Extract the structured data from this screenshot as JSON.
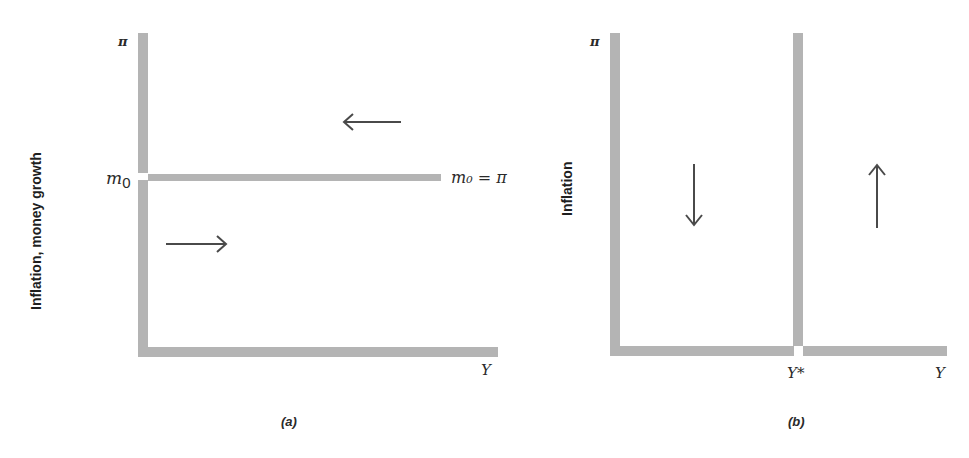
{
  "panel_a": {
    "caption": "(a)",
    "y_axis_label": "Inflation, money growth",
    "y_axis_symbol": "π",
    "x_axis_symbol": "Y",
    "y_tick_label": "m",
    "y_tick_subscript": "0",
    "line_label": "m₀ = π",
    "arrows": [
      {
        "direction": "left",
        "region": "above line"
      },
      {
        "direction": "right",
        "region": "below line"
      }
    ]
  },
  "panel_b": {
    "caption": "(b)",
    "y_axis_label": "Inflation",
    "y_axis_symbol": "π",
    "x_axis_symbol": "Y",
    "x_tick_label": "Y*",
    "arrows": [
      {
        "direction": "down",
        "region": "left of Y*"
      },
      {
        "direction": "up",
        "region": "right of Y*"
      }
    ]
  },
  "colors": {
    "axis": "#b4b4b4",
    "arrow": "#4a4a4a",
    "text": "#2a2a2a"
  }
}
